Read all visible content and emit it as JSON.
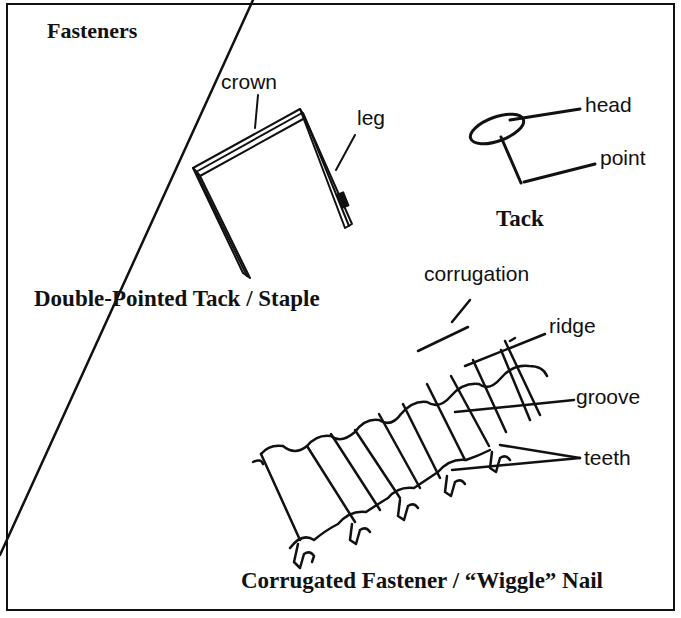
{
  "diagram": {
    "title": "Fasteners",
    "staple": {
      "caption": "Double-Pointed Tack / Staple",
      "labels": {
        "crown": "crown",
        "leg": "leg"
      }
    },
    "tack": {
      "caption": "Tack",
      "labels": {
        "head": "head",
        "point": "point"
      }
    },
    "corrugated": {
      "caption": "Corrugated Fastener / “Wiggle” Nail",
      "labels": {
        "corrugation": "corrugation",
        "ridge": "ridge",
        "groove": "groove",
        "teeth": "teeth"
      }
    },
    "colors": {
      "ink": "#111111",
      "background": "#ffffff"
    }
  }
}
